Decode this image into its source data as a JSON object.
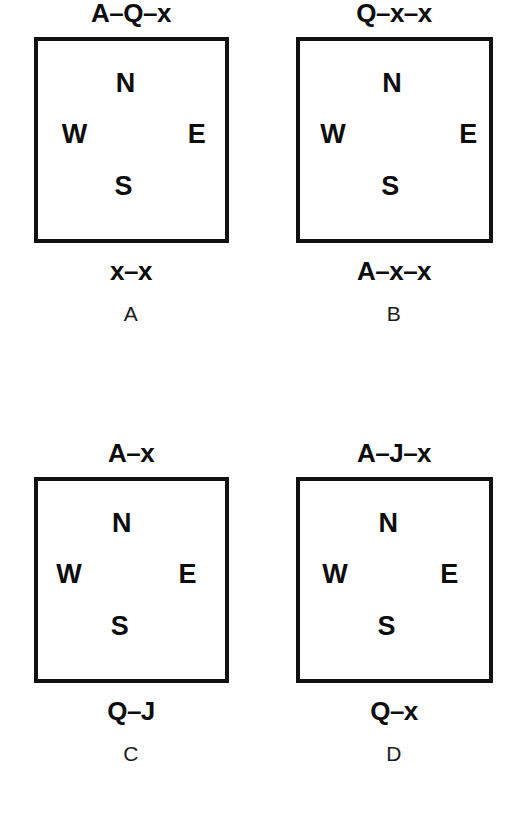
{
  "figure": {
    "kind": "compass-orientation-panels",
    "panel_count": 4,
    "ink_color": "#111111",
    "paper_color": "#fefefe"
  },
  "compass": {
    "north": "N",
    "west": "W",
    "east": "E",
    "south": "S"
  },
  "panels": [
    {
      "id": "A",
      "header": "A–Q–x",
      "footer": "x–x",
      "compass": {
        "north": "N",
        "west": "W",
        "east": "E",
        "south": "S"
      }
    },
    {
      "id": "B",
      "header": "Q–x–x",
      "footer": "A–x–x",
      "compass": {
        "north": "N",
        "west": "W",
        "east": "E",
        "south": "S"
      }
    },
    {
      "id": "C",
      "header": "A–x",
      "footer": "Q–J",
      "compass": {
        "north": "N",
        "west": "W",
        "east": "E",
        "south": "S"
      }
    },
    {
      "id": "D",
      "header": "A–J–x",
      "footer": "Q–x",
      "compass": {
        "north": "N",
        "west": "W",
        "east": "E",
        "south": "S"
      }
    }
  ]
}
